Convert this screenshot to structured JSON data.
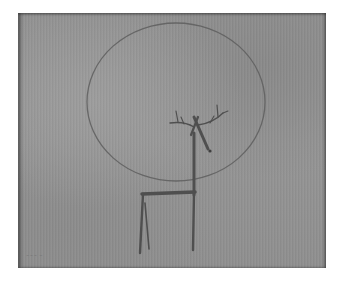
{
  "artwork": {
    "subject": "Stylized deer beneath a large circle",
    "signature": "~~~ ~",
    "colors": {
      "background": "#ffffff",
      "canvas": "#939393",
      "line": "#5e5e5e",
      "deer": "#4f4f4f"
    }
  }
}
